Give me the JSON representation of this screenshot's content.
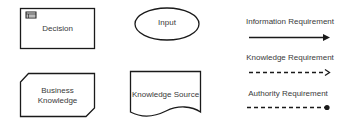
{
  "shapes": {
    "decision": {
      "label": "Decision"
    },
    "input": {
      "label": "Input"
    },
    "business_knowledge": {
      "label_line1": "Business",
      "label_line2": "Knowledge"
    },
    "knowledge_source": {
      "label": "Knowledge Source"
    }
  },
  "connectors": [
    {
      "label": "Information Requirement",
      "style": "solid",
      "end": "filled-arrow"
    },
    {
      "label": "Knowledge Requirement",
      "style": "dashed",
      "end": "open-arrow"
    },
    {
      "label": "Authority Requirement",
      "style": "dashed",
      "end": "filled-circle"
    }
  ],
  "colors": {
    "stroke": "#1a1a1a",
    "text": "#3a3a3a",
    "background": "#ffffff"
  }
}
